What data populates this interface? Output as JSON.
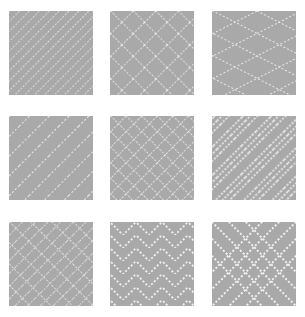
{
  "canvas": {
    "width": 305,
    "height": 317,
    "background_color": "#ffffff"
  },
  "grid": {
    "rows": 3,
    "columns": 3,
    "tile_count": 9,
    "tile_size": 84,
    "tile_background_color": "#a9a9a9",
    "pattern_line_color": "#f2f2f2",
    "pattern_style": "dotted-dashed-lines"
  },
  "tiles": [
    {
      "index": 0,
      "position": "row-1-col-1",
      "pattern_name": "dense-diagonal-stripes-descending",
      "description": "Closely spaced dotted diagonal lines running top-left to bottom-right",
      "direction": "descending",
      "spacing": 7,
      "angle": 45
    },
    {
      "index": 1,
      "position": "row-1-col-2",
      "pattern_name": "crosshatch-diamond-grid",
      "description": "Dotted crosshatch forming a diamond lattice",
      "direction": "both",
      "spacing": 16,
      "angle": 45
    },
    {
      "index": 2,
      "position": "row-1-col-3",
      "pattern_name": "elongated-diamond-lattice",
      "description": "Tall argyle style diamonds formed by steep dotted diagonals",
      "direction": "both",
      "spacing": 20,
      "angle": 63
    },
    {
      "index": 3,
      "position": "row-2-col-1",
      "pattern_name": "sparse-diagonal-stripes-descending",
      "description": "Widely spaced dotted diagonal lines running top-left to bottom-right",
      "direction": "descending",
      "spacing": 14,
      "angle": 45
    },
    {
      "index": 4,
      "position": "row-2-col-2",
      "pattern_name": "dense-crosshatch-diamonds",
      "description": "Tight dotted crosshatch producing small diamonds",
      "direction": "both",
      "spacing": 11,
      "angle": 45
    },
    {
      "index": 5,
      "position": "row-2-col-3",
      "pattern_name": "banded-diagonal-groups",
      "description": "Groups of three dotted diagonals separated by plain bands",
      "direction": "descending",
      "spacing": 5,
      "angle": 45
    },
    {
      "index": 6,
      "position": "row-3-col-1",
      "pattern_name": "mixed-dense-crosshatch",
      "description": "Dense overlapping crosshatch with uneven diamond cells",
      "direction": "both",
      "spacing": 9,
      "angle": 45
    },
    {
      "index": 7,
      "position": "row-3-col-2",
      "pattern_name": "chevron-zigzag",
      "description": "Nested dotted chevrons forming a herringbone zigzag",
      "direction": "chevron",
      "spacing": 13,
      "angle": 45
    },
    {
      "index": 8,
      "position": "row-3-col-3",
      "pattern_name": "large-x-cross",
      "description": "Large dotted X crossing corner to corner with nested chevrons",
      "direction": "both",
      "spacing": 17,
      "angle": 45
    }
  ]
}
